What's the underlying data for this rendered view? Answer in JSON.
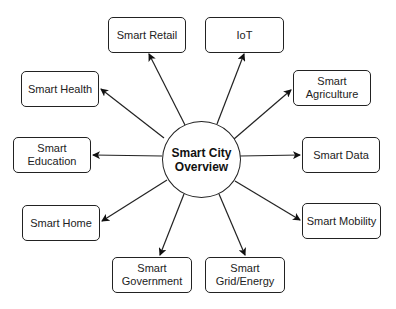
{
  "hub": {
    "label_line1": "Smart City",
    "label_line2": "Overview"
  },
  "nodes": [
    {
      "id": "retail",
      "line1": "Smart Retail",
      "line2": ""
    },
    {
      "id": "iot",
      "line1": "IoT",
      "line2": ""
    },
    {
      "id": "health",
      "line1": "Smart Health",
      "line2": ""
    },
    {
      "id": "agriculture",
      "line1": "Smart",
      "line2": "Agriculture"
    },
    {
      "id": "education",
      "line1": "Smart",
      "line2": "Education"
    },
    {
      "id": "data",
      "line1": "Smart Data",
      "line2": ""
    },
    {
      "id": "home",
      "line1": "Smart Home",
      "line2": ""
    },
    {
      "id": "mobility",
      "line1": "Smart Mobility",
      "line2": ""
    },
    {
      "id": "government",
      "line1": "Smart",
      "line2": "Government"
    },
    {
      "id": "grid",
      "line1": "Smart",
      "line2": "Grid/Energy"
    }
  ],
  "edges": [
    {
      "from": "hub",
      "to": "retail"
    },
    {
      "from": "hub",
      "to": "iot"
    },
    {
      "from": "hub",
      "to": "health"
    },
    {
      "from": "hub",
      "to": "agriculture"
    },
    {
      "from": "hub",
      "to": "education"
    },
    {
      "from": "hub",
      "to": "data"
    },
    {
      "from": "hub",
      "to": "home"
    },
    {
      "from": "hub",
      "to": "mobility"
    },
    {
      "from": "hub",
      "to": "government"
    },
    {
      "from": "hub",
      "to": "grid"
    }
  ]
}
